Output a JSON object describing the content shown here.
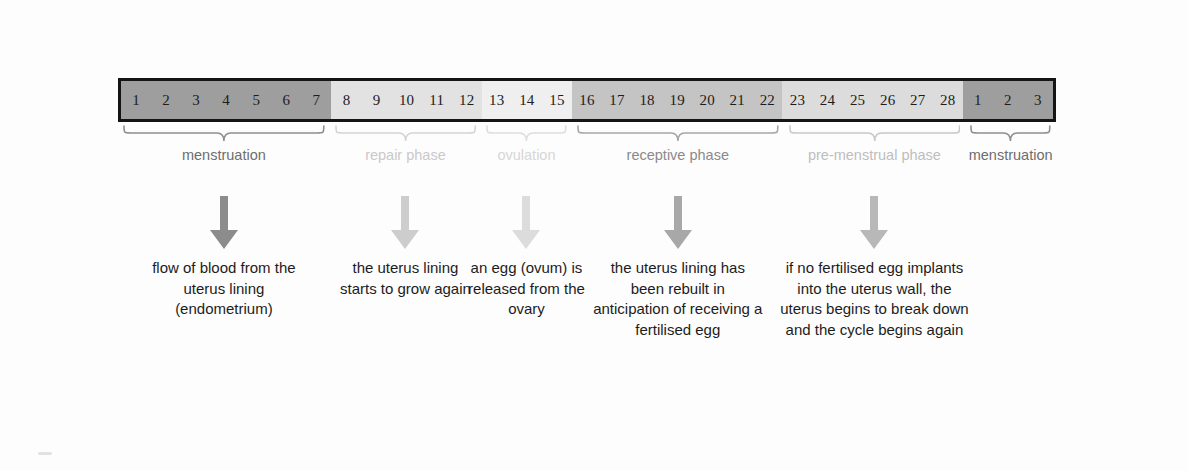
{
  "diagram": {
    "bar": {
      "segments": [
        {
          "name": "menstruation",
          "color": "#9e9e9e",
          "days": [
            "1",
            "2",
            "3",
            "4",
            "5",
            "6",
            "7"
          ]
        },
        {
          "name": "repair phase",
          "color": "#e2e2e2",
          "days": [
            "8",
            "9",
            "10",
            "11",
            "12"
          ]
        },
        {
          "name": "ovulation",
          "color": "#efefef",
          "days": [
            "13",
            "14",
            "15"
          ]
        },
        {
          "name": "receptive phase",
          "color": "#c4c4c4",
          "days": [
            "16",
            "17",
            "18",
            "19",
            "20",
            "21",
            "22"
          ]
        },
        {
          "name": "pre-menstrual phase",
          "color": "#dcdcdc",
          "days": [
            "23",
            "24",
            "25",
            "26",
            "27",
            "28"
          ]
        },
        {
          "name": "menstruation",
          "color": "#9e9e9e",
          "days": [
            "1",
            "2",
            "3"
          ]
        }
      ],
      "border_color": "#141414"
    },
    "phases": [
      {
        "label": "menstruation",
        "label_color": "#6e6e6e",
        "brace_color": "#8f8f8f"
      },
      {
        "label": "repair phase",
        "label_color": "#c9c9c9",
        "brace_color": "#d4d4d4"
      },
      {
        "label": "ovulation",
        "label_color": "#d6d6d6",
        "brace_color": "#dedede"
      },
      {
        "label": "receptive phase",
        "label_color": "#8a8a8a",
        "brace_color": "#a6a6a6"
      },
      {
        "label": "pre-menstrual phase",
        "label_color": "#bdbdbd",
        "brace_color": "#c8c8c8"
      },
      {
        "label": "menstruation",
        "label_color": "#6e6e6e",
        "brace_color": "#8f8f8f"
      }
    ],
    "arrows": [
      {
        "phase": "menstruation",
        "color": "#8c8c8c"
      },
      {
        "phase": "repair phase",
        "color": "#cdcdcd"
      },
      {
        "phase": "ovulation",
        "color": "#dcdcdc"
      },
      {
        "phase": "receptive phase",
        "color": "#a8a8a8"
      },
      {
        "phase": "pre-menstrual phase",
        "color": "#b8b8b8"
      }
    ],
    "descriptions": [
      {
        "phase": "menstruation",
        "text": "flow of blood from the uterus lining (endometrium)"
      },
      {
        "phase": "repair phase",
        "text": "the uterus lining starts to grow again"
      },
      {
        "phase": "ovulation",
        "text": "an egg (ovum) is released from the ovary"
      },
      {
        "phase": "receptive phase",
        "text": "the uterus lining has been rebuilt in anticipation of receiving a fertilised egg"
      },
      {
        "phase": "pre-menstrual phase",
        "text": "if no fertilised egg implants into the uterus wall, the uterus begins to break down and the cycle begins again"
      }
    ]
  }
}
